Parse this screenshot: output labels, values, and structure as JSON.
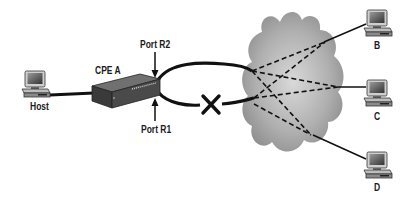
{
  "diagram": {
    "nodes": {
      "host": {
        "label": "Host",
        "type": "computer"
      },
      "cpe_a": {
        "label": "CPE  A",
        "type": "router"
      },
      "b": {
        "label": "B",
        "type": "computer"
      },
      "c": {
        "label": "C",
        "type": "computer"
      },
      "d": {
        "label": "D",
        "type": "computer"
      },
      "cloud": {
        "label": "",
        "type": "network-cloud"
      }
    },
    "ports": {
      "r2": {
        "label": "Port R2"
      },
      "r1": {
        "label": "Port R1"
      }
    },
    "links": [
      {
        "from": "host",
        "to": "cpe_a",
        "style": "solid"
      },
      {
        "from": "cpe_a.r2",
        "to": "cloud",
        "style": "solid"
      },
      {
        "from": "cpe_a.r1",
        "to": "cloud",
        "style": "solid",
        "failed": true
      },
      {
        "from": "cloud",
        "to": "b",
        "style": "solid"
      },
      {
        "from": "cloud",
        "to": "c",
        "style": "solid"
      },
      {
        "from": "cloud",
        "to": "d",
        "style": "solid"
      }
    ],
    "virtual_circuits": "dashed lines from R1/R2 entry points to B, C, D through cloud",
    "colors": {
      "line": "#111111",
      "cloud_dark": "#8a8a8a",
      "cloud_light": "#d6d6d6"
    }
  }
}
